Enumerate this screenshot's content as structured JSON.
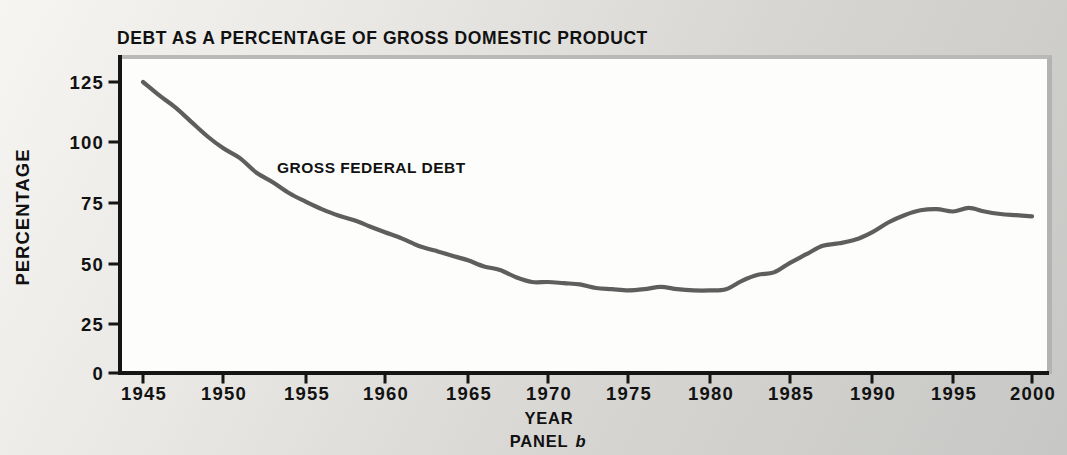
{
  "title": "DEBT AS A PERCENTAGE OF GROSS DOMESTIC PRODUCT",
  "series_label": "GROSS FEDERAL DEBT",
  "x_axis_label": "YEAR",
  "y_axis_label": "PERCENTAGE",
  "panel": {
    "prefix": "PANEL",
    "letter": "b"
  },
  "colors": {
    "line": "#5e5e5e",
    "axis": "#151515",
    "text": "#111111",
    "plot_background": "#fdfdfb",
    "page_background": "#d6d5d2",
    "frame_border": "#b5b5b3"
  },
  "chart_data": {
    "type": "line",
    "title": "DEBT AS A PERCENTAGE OF GROSS DOMESTIC PRODUCT",
    "xlabel": "YEAR",
    "ylabel": "PERCENTAGE",
    "caption": "PANEL b",
    "annotation": "GROSS FEDERAL DEBT",
    "x_ticks": [
      1945,
      1950,
      1955,
      1960,
      1965,
      1970,
      1975,
      1980,
      1985,
      1990,
      1995,
      2000
    ],
    "y_ticks": [
      0,
      25,
      50,
      75,
      100,
      125
    ],
    "xlim": [
      1945,
      2001
    ],
    "ylim": [
      0,
      137
    ],
    "grid": false,
    "legend_position": "inline annotation",
    "series": [
      {
        "name": "GROSS FEDERAL DEBT",
        "x": [
          1945,
          1946,
          1947,
          1948,
          1949,
          1950,
          1951,
          1952,
          1953,
          1954,
          1955,
          1956,
          1957,
          1958,
          1959,
          1960,
          1961,
          1962,
          1963,
          1964,
          1965,
          1966,
          1967,
          1968,
          1969,
          1970,
          1971,
          1972,
          1973,
          1974,
          1975,
          1976,
          1977,
          1978,
          1979,
          1980,
          1981,
          1982,
          1983,
          1984,
          1985,
          1986,
          1987,
          1988,
          1989,
          1990,
          1991,
          1992,
          1993,
          1994,
          1995,
          1996,
          1997,
          1998,
          1999,
          2000
        ],
        "values": [
          125,
          119.5,
          114.5,
          108.5,
          102.5,
          97.5,
          93.5,
          87.5,
          83.5,
          79,
          75.5,
          72.5,
          70,
          68,
          65.5,
          63,
          60.5,
          57.5,
          55.5,
          53.5,
          51.5,
          49,
          47.5,
          44.5,
          42.5,
          42.5,
          42,
          41.5,
          40,
          39.5,
          39,
          39.5,
          40.5,
          39.5,
          39,
          39,
          39.5,
          43,
          45.5,
          46.5,
          50.5,
          54,
          57.5,
          58.5,
          60,
          63,
          67,
          70,
          72,
          72.5,
          71.5,
          73,
          71.5,
          70.5,
          70,
          69.5
        ]
      }
    ]
  }
}
